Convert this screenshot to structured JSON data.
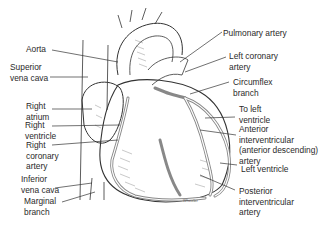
{
  "diagram": {
    "labels_left": [
      {
        "id": "aorta",
        "lines": [
          "Aorta"
        ]
      },
      {
        "id": "superior-vena-cava",
        "lines": [
          "Superior",
          "vena cava"
        ]
      },
      {
        "id": "right-atrium",
        "lines": [
          "Right",
          "atrium"
        ]
      },
      {
        "id": "right-ventricle",
        "lines": [
          "Right",
          "ventricle"
        ]
      },
      {
        "id": "right-coronary-artery",
        "lines": [
          "Right",
          "coronary",
          "artery"
        ]
      },
      {
        "id": "inferior-vena-cava",
        "lines": [
          "Inferior",
          "vena cava"
        ]
      },
      {
        "id": "marginal-branch",
        "lines": [
          "Marginal",
          "branch"
        ]
      }
    ],
    "labels_right": [
      {
        "id": "pulmonary-artery",
        "lines": [
          "Pulmonary artery"
        ]
      },
      {
        "id": "left-coronary-artery",
        "lines": [
          "Left coronary",
          "artery"
        ]
      },
      {
        "id": "circumflex-branch",
        "lines": [
          "Circumflex",
          "branch"
        ]
      },
      {
        "id": "to-left-ventricle",
        "lines": [
          "To left",
          "ventricle"
        ]
      },
      {
        "id": "anterior-interventricular-artery",
        "lines": [
          "Anterior",
          "interventricular",
          "(anterior descending)",
          "artery"
        ]
      },
      {
        "id": "left-ventricle",
        "lines": [
          "Left ventricle"
        ]
      },
      {
        "id": "posterior-interventricular-artery",
        "lines": [
          "Posterior",
          "interventricular",
          "artery"
        ]
      }
    ],
    "signature": "Wheeler"
  }
}
